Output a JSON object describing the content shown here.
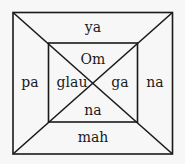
{
  "diagram": {
    "labels": {
      "outer_top": "ya",
      "outer_left": "pa",
      "outer_right": "na",
      "outer_bottom": "mah",
      "inner_top": "Om",
      "inner_left": "glau",
      "inner_right": "ga",
      "inner_bottom": "na"
    },
    "colors": {
      "background": "#f7f7f7",
      "stroke": "#1a1a1a"
    }
  }
}
